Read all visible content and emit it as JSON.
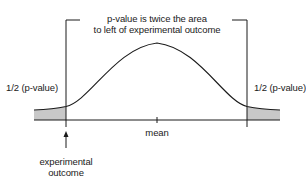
{
  "title": {
    "line1": "p-value is twice the area",
    "line2": "to left of experimental outcome"
  },
  "labels": {
    "left_tail": "1/2 (p-value)",
    "right_tail": "1/2 (p-value)",
    "mean": "mean",
    "outcome_line1": "experimental",
    "outcome_line2": "outcome"
  },
  "colors": {
    "line": "#1a1a1a",
    "shade": "#c8c8c8",
    "background": "#ffffff"
  },
  "icons": {
    "outcome_marker": "up-arrow-icon"
  }
}
